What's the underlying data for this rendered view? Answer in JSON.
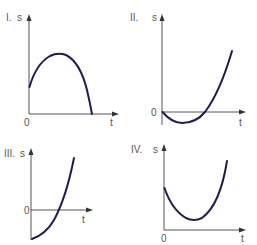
{
  "graphs": [
    {
      "id": "I",
      "label": "I.",
      "y_axis_label": "s",
      "x_axis_label": "t",
      "origin_label": "0",
      "shape": "concave-down parabola starting at positive s, rising to a maximum and falling to s=0"
    },
    {
      "id": "II",
      "label": "II.",
      "y_axis_label": "s",
      "x_axis_label": "t",
      "origin_label": "0",
      "shape": "concave-up parabola starting at s=0, dipping below zero to a minimum, then rising above zero"
    },
    {
      "id": "III",
      "label": "III.",
      "y_axis_label": "s",
      "x_axis_label": "t",
      "origin_label": "0",
      "shape": "concave-up curve starting at negative s, increasing through zero"
    },
    {
      "id": "IV",
      "label": "IV.",
      "y_axis_label": "s",
      "x_axis_label": "t",
      "origin_label": "0",
      "shape": "concave-up parabola starting at positive s, decreasing to a minimum above zero, then rising"
    }
  ],
  "colors": {
    "curve": "#1f1d4d",
    "axis": "#555555"
  }
}
